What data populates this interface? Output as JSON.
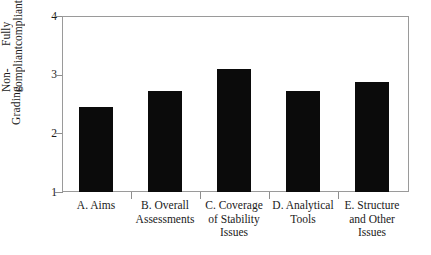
{
  "chart_data": {
    "type": "bar",
    "title": "",
    "subtitle": "",
    "xlabel": "",
    "ylabel": "Grading",
    "categories": [
      "A. Aims",
      "B. Overall Assessments",
      "C. Coverage of Stability Issues",
      "D. Analytical Tools",
      "E. Structure and Other Issues"
    ],
    "values": [
      2.45,
      2.73,
      3.1,
      2.73,
      2.87
    ],
    "ylim": [
      1,
      4
    ],
    "yticks": [
      1,
      2,
      3,
      4
    ],
    "ytick_labels": [
      "1",
      "2",
      "3",
      "4"
    ],
    "grid": false,
    "legend": null,
    "bar_color": "#0b0b0b",
    "frame_color": "#9a9a9a",
    "axis_endpoint_labels": {
      "top": [
        "Fully",
        "compliant"
      ],
      "bottom": [
        "Non-",
        "compliant"
      ]
    }
  },
  "axis": {
    "y_title": "Grading",
    "top_caption_line1": "Fully",
    "top_caption_line2": "compliant",
    "bottom_caption_line1": "Non-",
    "bottom_caption_line2": "compliant",
    "tick_4": "4",
    "tick_3": "3",
    "tick_2": "2",
    "tick_1": "1"
  },
  "xlabels": [
    {
      "line1": "A. Aims",
      "line2": "",
      "line3": ""
    },
    {
      "line1": "B. Overall",
      "line2": "Assessments",
      "line3": ""
    },
    {
      "line1": "C. Coverage",
      "line2": "of Stability",
      "line3": "Issues"
    },
    {
      "line1": "D. Analytical",
      "line2": "Tools",
      "line3": ""
    },
    {
      "line1": "E. Structure",
      "line2": "and Other",
      "line3": "Issues"
    }
  ]
}
